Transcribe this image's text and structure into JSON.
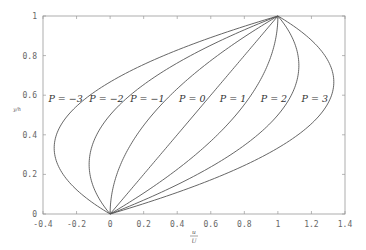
{
  "chart_data": {
    "type": "line",
    "title": "",
    "xlabel": "u/U",
    "ylabel": "y/h",
    "xlim": [
      -0.4,
      1.4
    ],
    "ylim": [
      0,
      1
    ],
    "grid": false,
    "legend": "inline labels at y≈0.58",
    "xticks": [
      "-0.4",
      "-0.2",
      "0",
      "0.2",
      "0.4",
      "0.6",
      "0.8",
      "1",
      "1.2",
      "1.4"
    ],
    "yticks": [
      "0",
      "0.2",
      "0.4",
      "0.6",
      "0.8",
      "1"
    ],
    "model": "u/U = y/h + P*(y/h)*(1 - y/h)",
    "series": [
      {
        "name": "P = -3",
        "P": -3,
        "label": "P = −3",
        "min_u": -0.333,
        "at_y": 0.333
      },
      {
        "name": "P = -2",
        "P": -2,
        "label": "P = −2",
        "min_u": -0.125,
        "at_y": 0.25
      },
      {
        "name": "P = -1",
        "P": -1,
        "label": "P = −1"
      },
      {
        "name": "P = 0",
        "P": 0,
        "label": "P = 0"
      },
      {
        "name": "P = 1",
        "P": 1,
        "label": "P = 1"
      },
      {
        "name": "P = 2",
        "P": 2,
        "label": "P = 2",
        "max_u": 1.125,
        "at_y": 0.75
      },
      {
        "name": "P = 3",
        "P": 3,
        "label": "P = 3",
        "max_u": 1.333,
        "at_y": 0.667
      }
    ],
    "sample_y": [
      0,
      0.1,
      0.2,
      0.3,
      0.4,
      0.5,
      0.6,
      0.7,
      0.8,
      0.9,
      1.0
    ],
    "color": "#555555"
  }
}
